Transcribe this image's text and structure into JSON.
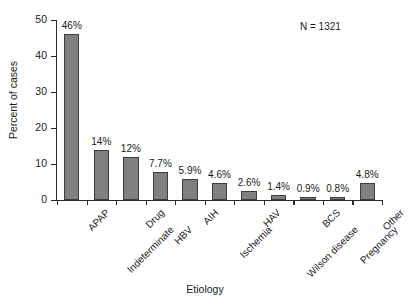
{
  "chart_data": {
    "type": "bar",
    "title": "",
    "xlabel": "Etiology",
    "ylabel": "Percent of cases",
    "ylim": [
      0,
      50
    ],
    "yticks": [
      "0",
      "10",
      "20",
      "30",
      "40",
      "50"
    ],
    "grid": false,
    "legend": null,
    "annotation": "N = 1321",
    "bar_color": "#808080",
    "bar_edge_color": "#3d3d3d",
    "categories": [
      "APAP",
      "Indeterminate",
      "Drug",
      "HBV",
      "AIH",
      "Ischemia",
      "HAV",
      "Wilson disease",
      "BCS",
      "Pregnancy",
      "Other"
    ],
    "values": [
      46,
      14,
      12,
      7.7,
      5.9,
      4.6,
      2.6,
      1.4,
      0.9,
      0.8,
      4.8
    ],
    "data_labels": [
      "46%",
      "14%",
      "12%",
      "7.7%",
      "5.9%",
      "4.6%",
      "2.6%",
      "1.4%",
      "0.9%",
      "0.8%",
      "4.8%"
    ]
  }
}
